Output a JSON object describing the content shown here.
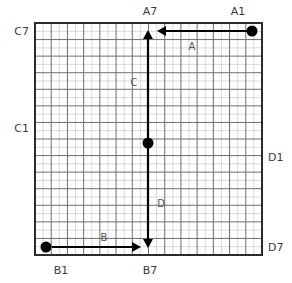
{
  "canvas": {
    "width": 292,
    "height": 283,
    "background": "#ffffff"
  },
  "grid": {
    "x": 35,
    "y": 23,
    "width": 227,
    "height": 232,
    "major_cols": 14,
    "major_rows": 14,
    "minor_per_major": 2,
    "border_color": "#2b2b2b",
    "major_color": "#6e6e6e",
    "minor_color": "#c9c9c9",
    "fill": "#ffffff"
  },
  "axis_labels": [
    {
      "id": "A7",
      "text": "A7",
      "x": 150,
      "y": 15,
      "anchor": "middle",
      "side": "top"
    },
    {
      "id": "A1",
      "text": "A1",
      "x": 238,
      "y": 15,
      "anchor": "middle",
      "side": "top"
    },
    {
      "id": "C7",
      "text": "C7",
      "x": 29,
      "y": 35,
      "anchor": "end",
      "side": "left"
    },
    {
      "id": "C1",
      "text": "C1",
      "x": 29,
      "y": 132,
      "anchor": "end",
      "side": "left"
    },
    {
      "id": "D1",
      "text": "D1",
      "x": 268,
      "y": 161,
      "anchor": "start",
      "side": "right"
    },
    {
      "id": "D7",
      "text": "D7",
      "x": 268,
      "y": 251,
      "anchor": "start",
      "side": "right"
    },
    {
      "id": "B1",
      "text": "B1",
      "x": 61,
      "y": 274,
      "anchor": "middle",
      "side": "bottom"
    },
    {
      "id": "B7",
      "text": "B7",
      "x": 150,
      "y": 274,
      "anchor": "middle",
      "side": "bottom"
    }
  ],
  "segment_labels": [
    {
      "id": "A",
      "text": "A",
      "x": 192,
      "y": 50
    },
    {
      "id": "C",
      "text": "C",
      "x": 134,
      "y": 86
    },
    {
      "id": "D",
      "text": "D",
      "x": 161,
      "y": 207
    },
    {
      "id": "B",
      "text": "B",
      "x": 104,
      "y": 241
    }
  ],
  "arrows": [
    {
      "id": "arrow-a",
      "label": "A",
      "from": {
        "x": 252,
        "y": 31
      },
      "to": {
        "x": 157,
        "y": 31
      },
      "direction": "left",
      "color": "#000000"
    },
    {
      "id": "arrow-c",
      "label": "C",
      "from": {
        "x": 148,
        "y": 143
      },
      "to": {
        "x": 148,
        "y": 30
      },
      "direction": "up",
      "color": "#000000"
    },
    {
      "id": "arrow-d",
      "label": "D",
      "from": {
        "x": 148,
        "y": 143
      },
      "to": {
        "x": 148,
        "y": 248
      },
      "direction": "down",
      "color": "#000000"
    },
    {
      "id": "arrow-b",
      "label": "B",
      "from": {
        "x": 52,
        "y": 247
      },
      "to": {
        "x": 141,
        "y": 247
      },
      "direction": "right",
      "color": "#000000"
    }
  ],
  "points": [
    {
      "id": "point-a1",
      "x": 252,
      "y": 31,
      "r": 5.5,
      "color": "#000000"
    },
    {
      "id": "point-center",
      "x": 148,
      "y": 143,
      "r": 5.5,
      "color": "#000000"
    },
    {
      "id": "point-b1",
      "x": 46,
      "y": 247,
      "r": 5.5,
      "color": "#000000"
    }
  ],
  "style": {
    "stroke_width": 2.2,
    "arrow_head_len": 9,
    "arrow_head_half_width": 5
  }
}
